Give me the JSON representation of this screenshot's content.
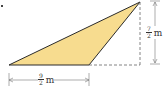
{
  "figure": {
    "type": "triangle",
    "fill_color": "#f7dc8f",
    "stroke_color": "#2b2b2b",
    "dash_color": "#555555",
    "vertices": {
      "bottom_left": [
        9,
        65
      ],
      "bottom_right": [
        89,
        65
      ],
      "top": [
        140,
        2
      ]
    }
  },
  "labels": {
    "base": {
      "numerator": "9",
      "denominator": "2",
      "unit": "m"
    },
    "height": {
      "numerator": "7",
      "denominator": "2",
      "unit": "m"
    }
  }
}
